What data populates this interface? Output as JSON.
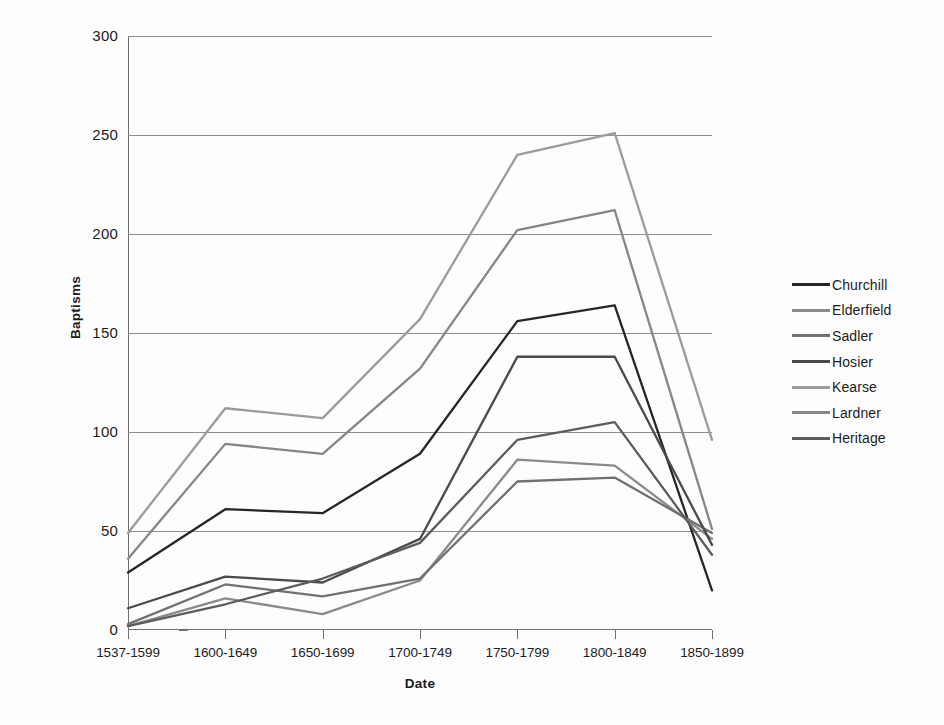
{
  "chart_data": {
    "type": "line",
    "title": "",
    "xlabel": "Date",
    "ylabel": "Baptisms",
    "categories": [
      "1537-1599",
      "1600-1649",
      "1650-1699",
      "1700-1749",
      "1750-1799",
      "1800-1849",
      "1850-1899"
    ],
    "ylim": [
      0,
      300
    ],
    "yticks": [
      0,
      50,
      100,
      150,
      200,
      250,
      300
    ],
    "ytick_labels": [
      "0",
      "50",
      "100",
      "150",
      "200",
      "250",
      "300"
    ],
    "grid": true,
    "legend_position": "right",
    "series": [
      {
        "name": "Churchill",
        "color": "#262626",
        "values": [
          29,
          61,
          59,
          89,
          156,
          164,
          20
        ]
      },
      {
        "name": "Elderfield",
        "color": "#8a8a8a",
        "values": [
          2,
          16,
          8,
          25,
          86,
          83,
          46
        ]
      },
      {
        "name": "Sadler",
        "color": "#707070",
        "values": [
          3,
          23,
          17,
          26,
          75,
          77,
          49
        ]
      },
      {
        "name": "Hosier",
        "color": "#4a4a4a",
        "values": [
          11,
          27,
          24,
          46,
          138,
          138,
          43
        ]
      },
      {
        "name": "Kearse",
        "color": "#9b9b9b",
        "values": [
          49,
          112,
          107,
          157,
          240,
          251,
          96
        ]
      },
      {
        "name": "Lardner",
        "color": "#868686",
        "values": [
          36,
          94,
          89,
          132,
          202,
          212,
          51
        ]
      },
      {
        "name": "Heritage",
        "color": "#5c5c5c",
        "values": [
          2,
          13,
          26,
          44,
          96,
          105,
          38
        ]
      }
    ]
  }
}
